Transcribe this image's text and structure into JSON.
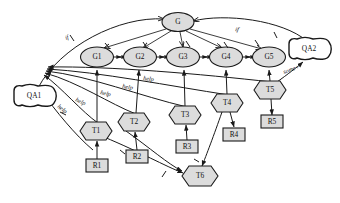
{
  "diagram": {
    "type": "goal-task-resource-graph",
    "nodes": {
      "root_goal": {
        "id": "G",
        "label": "G",
        "shape": "ellipse",
        "x": 178,
        "y": 22
      },
      "goals": [
        {
          "id": "G1",
          "label": "G1",
          "shape": "ellipse",
          "x": 97,
          "y": 57
        },
        {
          "id": "G2",
          "label": "G2",
          "shape": "ellipse",
          "x": 140,
          "y": 57
        },
        {
          "id": "G3",
          "label": "G3",
          "shape": "ellipse",
          "x": 183,
          "y": 57
        },
        {
          "id": "G4",
          "label": "G4",
          "shape": "ellipse",
          "x": 226,
          "y": 57
        },
        {
          "id": "G5",
          "label": "G5",
          "shape": "ellipse",
          "x": 269,
          "y": 57
        }
      ],
      "tasks": [
        {
          "id": "T1",
          "label": "T1",
          "shape": "hexagon",
          "x": 96,
          "y": 131
        },
        {
          "id": "T2",
          "label": "T2",
          "shape": "hexagon",
          "x": 134,
          "y": 122
        },
        {
          "id": "T3",
          "label": "T3",
          "shape": "hexagon",
          "x": 185,
          "y": 115
        },
        {
          "id": "T4",
          "label": "T4",
          "shape": "hexagon",
          "x": 227,
          "y": 103
        },
        {
          "id": "T5",
          "label": "T5",
          "shape": "hexagon",
          "x": 270,
          "y": 90
        },
        {
          "id": "T6",
          "label": "T6",
          "shape": "hexagon",
          "x": 200,
          "y": 176
        }
      ],
      "resources": [
        {
          "id": "R1",
          "label": "R1",
          "shape": "rectangle",
          "x": 97,
          "y": 165
        },
        {
          "id": "R2",
          "label": "R2",
          "shape": "rectangle",
          "x": 137,
          "y": 156
        },
        {
          "id": "R3",
          "label": "R3",
          "shape": "rectangle",
          "x": 187,
          "y": 146
        },
        {
          "id": "R4",
          "label": "R4",
          "shape": "rectangle",
          "x": 234,
          "y": 134
        },
        {
          "id": "R5",
          "label": "R5",
          "shape": "rectangle",
          "x": 272,
          "y": 122
        }
      ],
      "quality_attributes": [
        {
          "id": "QA1",
          "label": "QA1",
          "shape": "cloud",
          "x": 35,
          "y": 97
        },
        {
          "id": "QA2",
          "label": "QA2",
          "shape": "cloud",
          "x": 310,
          "y": 50
        }
      ]
    },
    "edge_labels": {
      "if_left": "if",
      "if_right": "if",
      "some_plus": "some+",
      "help_1": "help",
      "help_2": "help",
      "help_3": "help",
      "help_4": "help",
      "help_5": "help"
    },
    "colors": {
      "node_fill": "#dcdcdc",
      "qa_fill": "#ffffff",
      "stroke": "#1a1a1a",
      "background": "#ffffff"
    }
  }
}
